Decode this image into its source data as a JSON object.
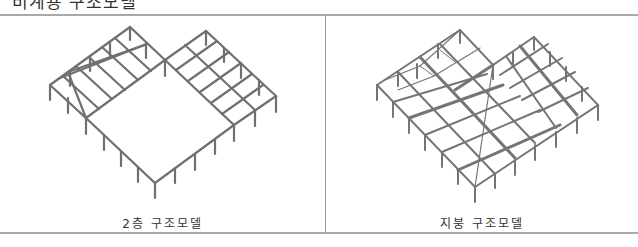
{
  "heading": {
    "text": "비계용 구조모델"
  },
  "figures": [
    {
      "caption": "2층 구조모델",
      "drawing": "isometric-frame-2nd-floor"
    },
    {
      "caption": "지붕 구조모델",
      "drawing": "isometric-frame-roof"
    }
  ],
  "colors": {
    "frame_line": "#a9a9a9",
    "member": "#6f6f6f",
    "text": "#333333"
  }
}
